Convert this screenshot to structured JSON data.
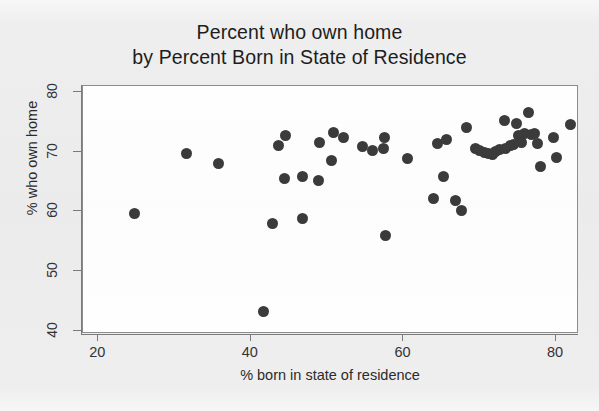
{
  "chart_data": {
    "type": "scatter",
    "title": "Percent who own home by Percent Born in State of Residence",
    "title_lines": [
      "Percent who own home",
      "by Percent Born in State of Residence"
    ],
    "xlabel": "% born in state of residence",
    "ylabel": "% who own home",
    "xlim": [
      18,
      83
    ],
    "ylim": [
      39.5,
      81
    ],
    "xticks": [
      20,
      40,
      60,
      80
    ],
    "yticks": [
      40,
      50,
      60,
      70,
      80
    ],
    "grid": false,
    "legend": null,
    "marker": {
      "shape": "circle",
      "color": "#3b3b3b",
      "size": 11
    },
    "background_color": "#eeeeee",
    "plot_background_color": "#ffffff",
    "axis_color": "#7b7b7b",
    "n_points": 51,
    "points": [
      {
        "x": 24.8,
        "y": 59.6
      },
      {
        "x": 31.5,
        "y": 69.7
      },
      {
        "x": 35.8,
        "y": 68.0
      },
      {
        "x": 41.7,
        "y": 43.2
      },
      {
        "x": 42.8,
        "y": 58.0
      },
      {
        "x": 43.6,
        "y": 71.0
      },
      {
        "x": 44.6,
        "y": 72.7
      },
      {
        "x": 44.4,
        "y": 65.6
      },
      {
        "x": 46.7,
        "y": 65.8
      },
      {
        "x": 46.8,
        "y": 58.8
      },
      {
        "x": 48.8,
        "y": 65.2
      },
      {
        "x": 50.8,
        "y": 73.2
      },
      {
        "x": 52.1,
        "y": 72.3
      },
      {
        "x": 49.0,
        "y": 71.5
      },
      {
        "x": 50.6,
        "y": 68.6
      },
      {
        "x": 54.6,
        "y": 70.9
      },
      {
        "x": 55.9,
        "y": 70.2
      },
      {
        "x": 57.4,
        "y": 70.6
      },
      {
        "x": 57.6,
        "y": 55.9
      },
      {
        "x": 57.5,
        "y": 72.4
      },
      {
        "x": 60.5,
        "y": 68.9
      },
      {
        "x": 63.9,
        "y": 62.2
      },
      {
        "x": 64.5,
        "y": 71.4
      },
      {
        "x": 65.2,
        "y": 65.9
      },
      {
        "x": 65.6,
        "y": 72.1
      },
      {
        "x": 66.8,
        "y": 61.9
      },
      {
        "x": 67.6,
        "y": 60.1
      },
      {
        "x": 68.3,
        "y": 74.0
      },
      {
        "x": 69.4,
        "y": 70.6
      },
      {
        "x": 69.9,
        "y": 70.2
      },
      {
        "x": 70.6,
        "y": 69.8
      },
      {
        "x": 71.2,
        "y": 69.7
      },
      {
        "x": 71.6,
        "y": 69.6
      },
      {
        "x": 72.0,
        "y": 70.0
      },
      {
        "x": 72.6,
        "y": 70.3
      },
      {
        "x": 73.4,
        "y": 70.5
      },
      {
        "x": 74.0,
        "y": 71.0
      },
      {
        "x": 74.4,
        "y": 71.2
      },
      {
        "x": 74.8,
        "y": 74.7
      },
      {
        "x": 75.1,
        "y": 72.8
      },
      {
        "x": 75.4,
        "y": 71.5
      },
      {
        "x": 75.8,
        "y": 73.0
      },
      {
        "x": 76.4,
        "y": 76.6
      },
      {
        "x": 76.8,
        "y": 72.9
      },
      {
        "x": 77.2,
        "y": 73.0
      },
      {
        "x": 77.5,
        "y": 71.4
      },
      {
        "x": 78.0,
        "y": 67.5
      },
      {
        "x": 79.6,
        "y": 72.3
      },
      {
        "x": 80.0,
        "y": 69.1
      },
      {
        "x": 81.9,
        "y": 74.6
      },
      {
        "x": 73.2,
        "y": 75.2
      }
    ]
  }
}
